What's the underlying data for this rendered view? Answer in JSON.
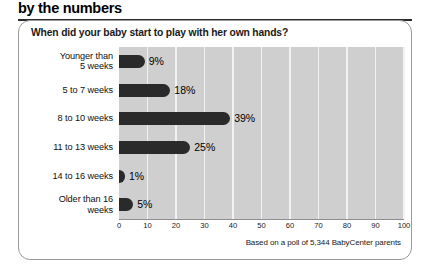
{
  "header": {
    "title": "by the numbers"
  },
  "card": {
    "question": "When did your baby start to play with her own hands?",
    "footnote": "Based on a poll of 5,344 BabyCenter parents"
  },
  "colors": {
    "bar": "#2a2a2a",
    "plot_background": "#cfcfcf",
    "gridline": "#f2f2f2",
    "card_border": "#9a9a9a",
    "rule": "#2b2b2b"
  },
  "chart_data": {
    "type": "bar",
    "orientation": "horizontal",
    "title": "When did your baby start to play with her own hands?",
    "xlabel": "",
    "ylabel": "",
    "xlim": [
      0,
      100
    ],
    "grid": true,
    "legend": null,
    "categories": [
      "Younger than 5 weeks",
      "5 to 7 weeks",
      "8 to 10 weeks",
      "11 to 13 weeks",
      "14 to 16 weeks",
      "Older than 16 weeks"
    ],
    "category_lines": [
      [
        "Younger than",
        "5 weeks"
      ],
      [
        "5 to 7 weeks"
      ],
      [
        "8 to 10 weeks"
      ],
      [
        "11 to 13 weeks"
      ],
      [
        "14 to 16 weeks"
      ],
      [
        "Older than 16",
        "weeks"
      ]
    ],
    "values": [
      9,
      18,
      39,
      25,
      1,
      5
    ],
    "value_labels": [
      "9%",
      "18%",
      "39%",
      "25%",
      "1%",
      "5%"
    ],
    "xticks": [
      0,
      10,
      20,
      30,
      40,
      50,
      60,
      70,
      80,
      90,
      100
    ],
    "xtick_labels": [
      "0",
      "10",
      "20",
      "30",
      "40",
      "50",
      "60",
      "70",
      "80",
      "90",
      "100"
    ],
    "annotation": "Based on a poll of 5,344 BabyCenter parents"
  }
}
